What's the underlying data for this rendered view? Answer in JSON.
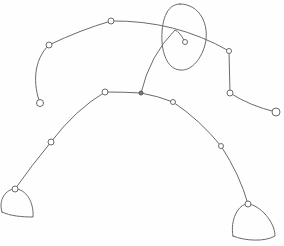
{
  "image": {
    "description": "Pencil sketch of a stick figure in a wide crouching stance with circular joint nodes, an oval head, and dome-shaped feet",
    "stroke_color": "#6a6a6a",
    "background": "#ffffff"
  },
  "figure": {
    "head": {
      "cx": 183,
      "cy": 37,
      "rx": 22,
      "ry": 33
    },
    "neck_node": {
      "x": 185,
      "y": 42
    },
    "hip_node": {
      "x": 141,
      "y": 93
    },
    "left_arm": [
      {
        "x": 111,
        "y": 21
      },
      {
        "x": 49,
        "y": 45
      },
      {
        "x": 40,
        "y": 103
      }
    ],
    "right_arm": [
      {
        "x": 229,
        "y": 51
      },
      {
        "x": 230,
        "y": 93
      },
      {
        "x": 276,
        "y": 112
      }
    ],
    "left_leg": [
      {
        "x": 105,
        "y": 92
      },
      {
        "x": 51,
        "y": 142
      },
      {
        "x": 15,
        "y": 189
      }
    ],
    "right_leg": [
      {
        "x": 173,
        "y": 102
      },
      {
        "x": 221,
        "y": 146
      },
      {
        "x": 248,
        "y": 204
      }
    ],
    "left_foot": {
      "top": {
        "x": 15,
        "y": 189
      },
      "left": 0,
      "right": 33,
      "bottom": 217
    },
    "right_foot": {
      "top": {
        "x": 248,
        "y": 204
      },
      "left": 232,
      "right": 275,
      "bottom": 241
    }
  }
}
